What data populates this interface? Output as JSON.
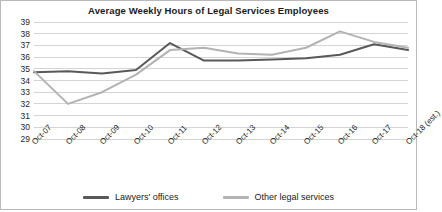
{
  "chart_data": {
    "type": "line",
    "title": "Average Weekly Hours of Legal Services Employees",
    "xlabel": "",
    "ylabel": "",
    "ylim": [
      29,
      39
    ],
    "yticks": [
      39,
      38,
      37,
      36,
      35,
      34,
      33,
      32,
      31,
      30,
      29
    ],
    "grid": true,
    "legend_position": "bottom",
    "categories": [
      "Oct-07",
      "Oct-08",
      "Oct-09",
      "Oct-10",
      "Oct-11",
      "Oct-12",
      "Oct-13",
      "Oct-14",
      "Oct-15",
      "Oct-16",
      "Oct-17",
      "Oct-18 (est.)"
    ],
    "series": [
      {
        "name": "Lawyers' offices",
        "color": "#595959",
        "values": [
          34.7,
          34.8,
          34.6,
          34.9,
          37.2,
          35.7,
          35.7,
          35.8,
          35.9,
          36.2,
          37.1,
          36.6
        ]
      },
      {
        "name": "Other legal services",
        "color": "#b3b3b3",
        "values": [
          34.8,
          32.0,
          33.0,
          34.5,
          36.6,
          36.8,
          36.3,
          36.2,
          36.8,
          38.2,
          37.3,
          36.8
        ]
      }
    ]
  },
  "colors": {
    "grid": "#d4d4d4",
    "frame": "#b9b9b9",
    "text": "#1a1a1a"
  }
}
